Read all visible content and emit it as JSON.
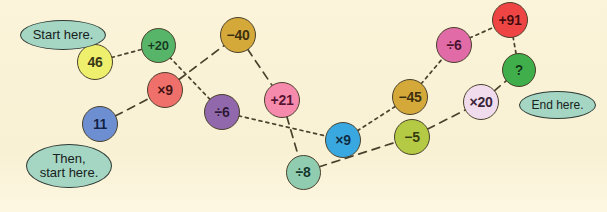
{
  "background_color": "#faf3d8",
  "labels": [
    {
      "id": "start-here",
      "text": "Start here.",
      "x": 20,
      "y": 20,
      "w": 86,
      "h": 30,
      "fill": "#a5d6c3",
      "font_size": 13
    },
    {
      "id": "then-start-here",
      "text": "Then,\nstart here.",
      "x": 26,
      "y": 144,
      "w": 86,
      "h": 44,
      "fill": "#a5d6c3",
      "font_size": 13
    },
    {
      "id": "end-here",
      "text": "End here.",
      "x": 519,
      "y": 91,
      "w": 77,
      "h": 28,
      "fill": "#a5d6c3",
      "font_size": 12
    }
  ],
  "nodes": [
    {
      "id": "n-46",
      "label": "46",
      "cx": 95,
      "cy": 62,
      "r": 18,
      "fill": "#efef6e",
      "text_color": "#3a3a10",
      "font_size": 14
    },
    {
      "id": "n-p20",
      "label": "+20",
      "cx": 158,
      "cy": 45,
      "r": 17.5,
      "fill": "#57b56a",
      "text_color": "#123d1b",
      "font_size": 13
    },
    {
      "id": "n-x9r",
      "label": "×9",
      "cx": 165,
      "cy": 90,
      "r": 18,
      "fill": "#ef6f6a",
      "text_color": "#4c100d",
      "font_size": 14
    },
    {
      "id": "n-11",
      "label": "11",
      "cx": 100,
      "cy": 124,
      "r": 18,
      "fill": "#6d8fd1",
      "text_color": "#0f2147",
      "font_size": 14
    },
    {
      "id": "n-m40",
      "label": "−40",
      "cx": 238,
      "cy": 35,
      "r": 18,
      "fill": "#d4a93a",
      "text_color": "#3f2f06",
      "font_size": 14
    },
    {
      "id": "n-d6p",
      "label": "÷6",
      "cx": 222,
      "cy": 112,
      "r": 18,
      "fill": "#9168ab",
      "text_color": "#2d1638",
      "font_size": 14
    },
    {
      "id": "n-p21",
      "label": "+21",
      "cx": 282,
      "cy": 100,
      "r": 18,
      "fill": "#f58aac",
      "text_color": "#5a1232",
      "font_size": 14
    },
    {
      "id": "n-d8",
      "label": "÷8",
      "cx": 303,
      "cy": 172,
      "r": 17.5,
      "fill": "#90cdb0",
      "text_color": "#11372a",
      "font_size": 14
    },
    {
      "id": "n-x9b",
      "label": "×9",
      "cx": 343,
      "cy": 140,
      "r": 18,
      "fill": "#3aa8e0",
      "text_color": "#062e47",
      "font_size": 14
    },
    {
      "id": "n-m45",
      "label": "−45",
      "cx": 410,
      "cy": 97,
      "r": 18,
      "fill": "#d4a93a",
      "text_color": "#3f2f06",
      "font_size": 14
    },
    {
      "id": "n-m5",
      "label": "−5",
      "cx": 412,
      "cy": 137,
      "r": 18,
      "fill": "#b4ca44",
      "text_color": "#343c07",
      "font_size": 14
    },
    {
      "id": "n-d6k",
      "label": "÷6",
      "cx": 454,
      "cy": 45,
      "r": 18,
      "fill": "#e06ba6",
      "text_color": "#4d0f30",
      "font_size": 14
    },
    {
      "id": "n-x20",
      "label": "×20",
      "cx": 481,
      "cy": 102,
      "r": 18,
      "fill": "#f0dced",
      "text_color": "#3b2438",
      "font_size": 14
    },
    {
      "id": "n-p91",
      "label": "+91",
      "cx": 510,
      "cy": 20,
      "r": 18,
      "fill": "#ee4444",
      "text_color": "#4b0707",
      "font_size": 14
    },
    {
      "id": "n-q",
      "label": "?",
      "cx": 519,
      "cy": 70,
      "r": 17,
      "fill": "#3fae4b",
      "text_color": "#0c3b12",
      "font_size": 14
    }
  ],
  "paths": {
    "dotted": {
      "name": "start-here-chain",
      "style": "dotted",
      "stroke": "#4a412c",
      "sequence": [
        "n-46",
        "n-p20",
        "n-d6p",
        "n-x9b",
        "n-m45",
        "n-d6k",
        "n-p91",
        "n-q"
      ]
    },
    "dashed": {
      "name": "then-start-here-chain",
      "style": "dashed",
      "stroke": "#4a412c",
      "sequence": [
        "n-11",
        "n-x9r",
        "n-m40",
        "n-p21",
        "n-d8",
        "n-m5",
        "n-x20",
        "n-q"
      ]
    }
  }
}
